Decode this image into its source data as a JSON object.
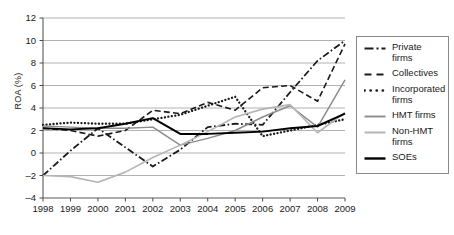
{
  "chart_data": {
    "type": "line",
    "title": "",
    "xlabel": "",
    "ylabel": "ROA (%)",
    "x": [
      1998,
      1999,
      2000,
      2001,
      2002,
      2003,
      2004,
      2005,
      2006,
      2007,
      2008,
      2009
    ],
    "categories": [
      "1998",
      "1999",
      "2000",
      "2001",
      "2002",
      "2003",
      "2004",
      "2005",
      "2006",
      "2007",
      "2008",
      "2009"
    ],
    "ylim": [
      -4,
      12
    ],
    "yticks": [
      -4,
      -2,
      0,
      2,
      4,
      6,
      8,
      10,
      12
    ],
    "xlim": [
      1998,
      2009
    ],
    "grid": "horizontal",
    "legend_position": "right",
    "series": [
      {
        "name": "Private firms",
        "style": "dash-dot",
        "color": "#1a1a1a",
        "values": [
          -2.0,
          0.2,
          2.2,
          0.5,
          -1.2,
          0.3,
          2.3,
          2.6,
          2.5,
          5.4,
          8.2,
          10.0
        ]
      },
      {
        "name": "Collectives",
        "style": "dashed",
        "color": "#1a1a1a",
        "values": [
          2.2,
          2.0,
          1.5,
          2.0,
          3.8,
          3.5,
          4.5,
          3.8,
          5.8,
          6.0,
          4.6,
          9.7
        ]
      },
      {
        "name": "Incorporated firms",
        "style": "dotted",
        "color": "#1a1a1a",
        "values": [
          2.5,
          2.7,
          2.6,
          2.6,
          3.0,
          3.4,
          4.2,
          5.0,
          1.5,
          2.0,
          2.5,
          3.0
        ]
      },
      {
        "name": "HMT firms",
        "style": "solid-medium",
        "color": "#8c8c8c",
        "values": [
          2.4,
          2.3,
          2.2,
          2.2,
          2.3,
          0.7,
          1.3,
          2.0,
          3.2,
          4.2,
          2.3,
          6.5
        ]
      },
      {
        "name": "Non-HMT firms",
        "style": "solid-light",
        "color": "#b5b5b5",
        "values": [
          -2.0,
          -2.1,
          -2.6,
          -1.7,
          -0.4,
          0.7,
          1.9,
          3.2,
          3.9,
          4.3,
          1.8,
          3.6
        ]
      },
      {
        "name": "SOEs",
        "style": "solid-bold",
        "color": "#000000",
        "values": [
          2.2,
          2.1,
          2.2,
          2.6,
          3.1,
          1.7,
          1.7,
          1.8,
          1.9,
          2.2,
          2.4,
          3.5
        ]
      }
    ]
  },
  "legend": {
    "items": [
      {
        "label": "Private firms"
      },
      {
        "label": "Collectives"
      },
      {
        "label": "Incorporated firms"
      },
      {
        "label": "HMT firms"
      },
      {
        "label": "Non-HMT firms"
      },
      {
        "label": "SOEs"
      }
    ]
  }
}
